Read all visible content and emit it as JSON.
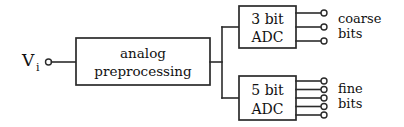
{
  "figure": {
    "type": "block-diagram",
    "background_color": "#ffffff",
    "line_color": "#2b2b2b",
    "text_color": "#111111"
  },
  "input": {
    "label_main": "V",
    "label_sub": "i",
    "terminal": "open-circle"
  },
  "blocks": [
    {
      "id": "preprocessing",
      "line1": "analog",
      "line2": "preprocessing"
    },
    {
      "id": "coarse_adc",
      "line1": "3  bit",
      "line2": "ADC",
      "bits": 3
    },
    {
      "id": "fine_adc",
      "line1": "5  bit",
      "line2": "ADC",
      "bits": 5
    }
  ],
  "outputs": [
    {
      "id": "coarse",
      "line1": "coarse",
      "line2": "bits",
      "count": 3
    },
    {
      "id": "fine",
      "line1": "fine",
      "line2": "bits",
      "count": 5
    }
  ]
}
